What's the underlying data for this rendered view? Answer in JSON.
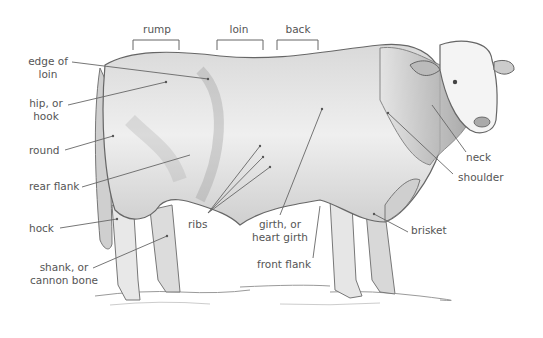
{
  "diagram": {
    "top_labels": [
      {
        "id": "rump",
        "text": "rump"
      },
      {
        "id": "loin",
        "text": "loin"
      },
      {
        "id": "back",
        "text": "back"
      }
    ],
    "labels": {
      "edge_of_loin": {
        "l1": "edge of",
        "l2": "loin"
      },
      "hip": {
        "l1": "hip, or",
        "l2": "hook"
      },
      "round": "round",
      "rear_flank": "rear flank",
      "hock": "hock",
      "shank": {
        "l1": "shank, or",
        "l2": "cannon bone"
      },
      "ribs": "ribs",
      "girth": {
        "l1": "girth, or",
        "l2": "heart girth"
      },
      "front_flank": "front flank",
      "brisket": "brisket",
      "neck": "neck",
      "shoulder": "shoulder"
    },
    "colors": {
      "text": "#555555",
      "line": "#666666",
      "sketch": "#8a8a8a",
      "shade": "#bdbdbd"
    }
  }
}
